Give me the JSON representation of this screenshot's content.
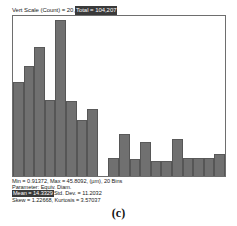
{
  "header": {
    "vert_scale_text": "Vert Scale (Count) = 20, ",
    "total_text": "Total = 104,207",
    "total_highlighted": true
  },
  "stats": {
    "line1": "Min = 0.91372, Max = 45.8092, (µm), 20 Bins",
    "line2": "Parameter: Equiv. Diam.",
    "line3_mean": "Mean = 14.3329",
    "line3_rest": " Std. Dev. = 11.2032",
    "line4": "Skew = 1.22668, Kurtosis = 3.57037"
  },
  "caption": "(c)",
  "colors": {
    "bar_fill": "#707070",
    "bar_edge": "#565656",
    "frame": "#6e6e6e",
    "highlight_bg": "#3a3a3a",
    "highlight_fg": "#ffffff"
  },
  "chart_data": {
    "type": "bar",
    "title": "",
    "subtitle": "Vert Scale (Count) = 20, Total = 104,207",
    "xlabel": "Equiv. Diam. (µm)",
    "ylabel": "Count",
    "grid": false,
    "legend": "none",
    "bins": 20,
    "x_min": 0.91372,
    "x_max": 45.8092,
    "vert_scale_count": 20,
    "total": 104207,
    "units": "µm",
    "parameter": "Equiv. Diam.",
    "statistics": {
      "min": 0.91372,
      "max": 45.8092,
      "mean": 14.3329,
      "std_dev": 11.2032,
      "skew": 1.22668,
      "kurtosis": 3.57037
    },
    "ylim": [
      0,
      20
    ],
    "categories": [
      "0.91-3.16",
      "3.16-5.40",
      "5.40-7.65",
      "7.65-9.90",
      "9.90-12.14",
      "12.14-14.39",
      "14.39-16.63",
      "16.63-18.88",
      "18.88-21.13",
      "21.13-23.37",
      "23.37-25.62",
      "25.62-27.86",
      "27.86-30.11",
      "30.11-32.36",
      "32.36-34.60",
      "34.60-36.85",
      "36.85-39.09",
      "39.09-41.34",
      "41.34-43.59",
      "43.59-45.81"
    ],
    "values": [
      11.8,
      13.7,
      16.1,
      9.5,
      19.5,
      9.4,
      7.0,
      8.4,
      0.0,
      2.3,
      5.2,
      2.1,
      4.2,
      1.9,
      1.9,
      4.6,
      2.2,
      2.3,
      2.2,
      2.8
    ]
  }
}
